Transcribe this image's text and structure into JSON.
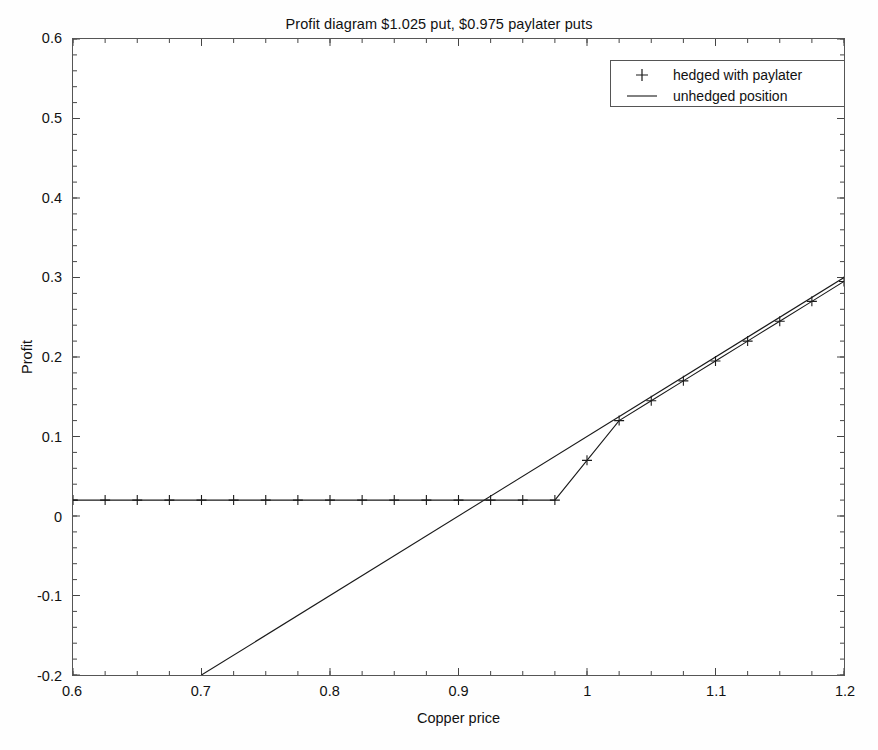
{
  "chart_data": {
    "type": "line",
    "title": "Profit diagram $1.025 put, $0.975 paylater puts",
    "xlabel": "Copper price",
    "ylabel": "Profit",
    "xlim": [
      0.6,
      1.2
    ],
    "ylim": [
      -0.2,
      0.6
    ],
    "xticks": [
      "0.6",
      "0.7",
      "0.8",
      "0.9",
      "1",
      "1.1",
      "1.2"
    ],
    "xtick_values": [
      0.6,
      0.7,
      0.8,
      0.9,
      1.0,
      1.1,
      1.2
    ],
    "yticks": [
      "0.6",
      "0.5",
      "0.4",
      "0.3",
      "0.2",
      "0.1",
      "0",
      "-0.1",
      "-0.2"
    ],
    "ytick_values": [
      0.6,
      0.5,
      0.4,
      0.3,
      0.2,
      0.1,
      0,
      -0.1,
      -0.2
    ],
    "grid": false,
    "legend_position": "top-right",
    "series": [
      {
        "name": "hedged with paylater",
        "marker": "+",
        "style": "line-with-plus-markers",
        "color": "#1a1a1a",
        "x": [
          0.6,
          0.625,
          0.65,
          0.675,
          0.7,
          0.725,
          0.75,
          0.775,
          0.8,
          0.825,
          0.85,
          0.875,
          0.9,
          0.925,
          0.95,
          0.975,
          1.0,
          1.025,
          1.05,
          1.075,
          1.1,
          1.125,
          1.15,
          1.175,
          1.2
        ],
        "values": [
          0.02,
          0.02,
          0.02,
          0.02,
          0.02,
          0.02,
          0.02,
          0.02,
          0.02,
          0.02,
          0.02,
          0.02,
          0.02,
          0.02,
          0.02,
          0.02,
          0.07,
          0.12,
          0.145,
          0.17,
          0.195,
          0.22,
          0.245,
          0.27,
          0.295
        ]
      },
      {
        "name": "unhedged position",
        "marker": "none",
        "style": "solid-line",
        "color": "#1a1a1a",
        "x": [
          0.7,
          1.2
        ],
        "values": [
          -0.2,
          0.3
        ]
      }
    ],
    "annotations": [
      {
        "text": "kink at strike 0.975",
        "x": 0.975,
        "y": 0.02
      },
      {
        "text": "kink at strike 1.025",
        "x": 1.025,
        "y": 0.12
      },
      {
        "text": "lines cross near 0.925",
        "x": 0.925,
        "y": 0.02
      }
    ]
  },
  "legend": {
    "items": [
      {
        "label": "hedged with paylater",
        "symbol": "plus-marker"
      },
      {
        "label": "unhedged position",
        "symbol": "line-segment"
      }
    ]
  }
}
